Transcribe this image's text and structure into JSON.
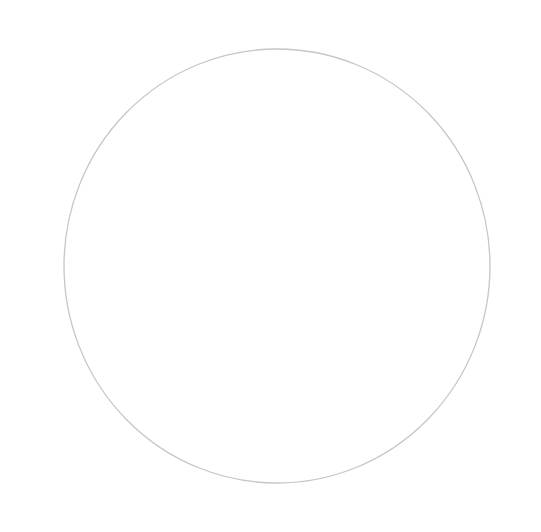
{
  "canvas": {
    "width": 541,
    "height": 532,
    "background": "#ffffff"
  },
  "drawing": {
    "subject": "hand-drawn pencil circle",
    "shape": {
      "type": "ellipse",
      "cx": 277,
      "cy": 266,
      "rx": 213,
      "ry": 217,
      "stroke": "#c6c6c6",
      "stroke_width": 1.3,
      "fill": "none"
    }
  }
}
